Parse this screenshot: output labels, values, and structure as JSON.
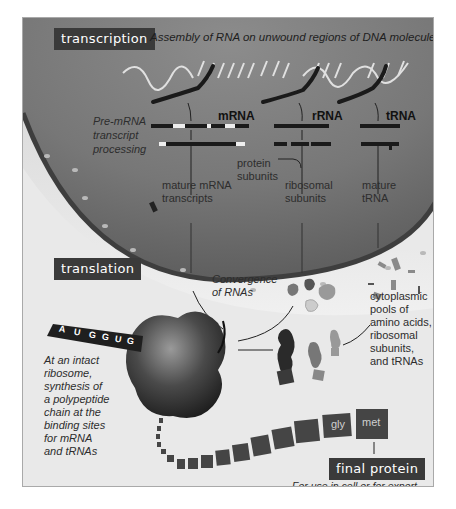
{
  "transcription": {
    "tag": "transcription",
    "caption": "Assembly of RNA on unwound regions of DNA molecule",
    "rna_types": [
      "mRNA",
      "rRNA",
      "tRNA"
    ],
    "processing_label": [
      "Pre-mRNA",
      "transcript",
      "processing"
    ],
    "protein_subunits": [
      "protein",
      "subunits"
    ],
    "products": {
      "mrna": [
        "mature mRNA",
        "transcripts"
      ],
      "rrna": [
        "ribosomal",
        "subunits"
      ],
      "trna": [
        "mature",
        "tRNA"
      ]
    }
  },
  "translation": {
    "tag": "translation",
    "convergence": [
      "Convergence",
      "of RNAs"
    ],
    "cytoplasmic_pools": [
      "cytoplasmic",
      "pools of",
      "amino acids,",
      "ribosomal",
      "subunits,",
      "and tRNAs"
    ],
    "ribosome_note": [
      "At an intact",
      "ribosome,",
      "synthesis of",
      "a polypeptide",
      "chain at the",
      "binding sites",
      "for mRNA",
      "and tRNAs"
    ],
    "codons": [
      "A",
      "U",
      "G",
      "G",
      "U",
      "G"
    ],
    "chain_residues": [
      "met",
      "gly",
      "ile",
      "val",
      "ala",
      "ser",
      "thr",
      "pro"
    ]
  },
  "final": {
    "tag": "final protein",
    "caption": "For use in cell or for export"
  },
  "colors": {
    "tag_bg": "#3a3a3a",
    "nucleus": "#7a7a7a",
    "membrane": "#3e3e3e",
    "cytoplasm": "#e9e9e9"
  }
}
